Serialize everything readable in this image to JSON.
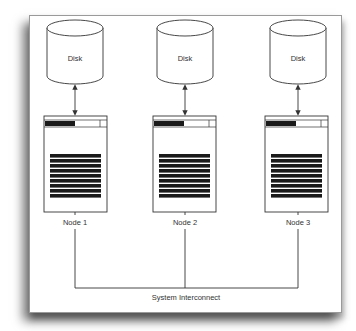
{
  "diagram": {
    "disks": [
      {
        "label": "Disk",
        "cx": 75
      },
      {
        "label": "Disk",
        "cx": 185
      },
      {
        "label": "Disk",
        "cx": 298
      }
    ],
    "nodes": [
      {
        "label": "Node 1",
        "x": 44
      },
      {
        "label": "Node 2",
        "x": 153
      },
      {
        "label": "Node 3",
        "x": 265
      }
    ],
    "interconnect": {
      "label": "System Interconnect"
    },
    "colors": {
      "line": "#333333",
      "fill": "#ffffff",
      "bar": "#1a1a1a",
      "frame": "#9a9a9a"
    }
  }
}
